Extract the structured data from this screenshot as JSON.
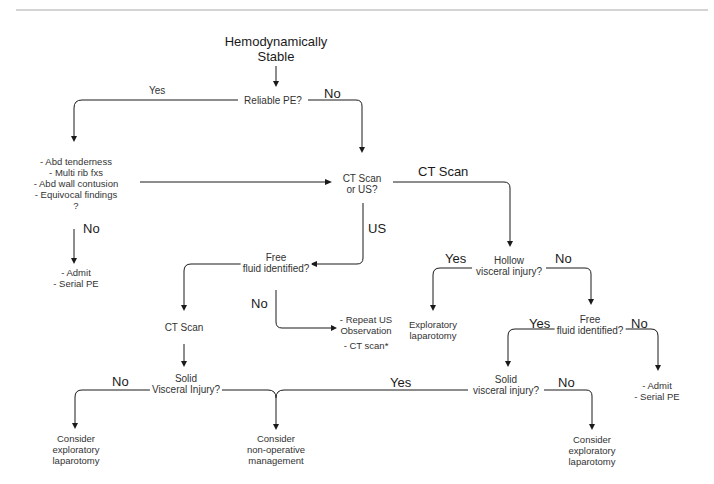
{
  "nodes": {
    "start": "Hemodynamically Stable",
    "start_l1": "Hemodynamically",
    "start_l2": "Stable",
    "reliable_pe": "Reliable PE?",
    "findings": [
      "- Abd tenderness",
      "- Multi rib fxs",
      "- Abd wall contusion",
      "- Equivocal findings",
      "?"
    ],
    "admit_serial_left": [
      "- Admit",
      "- Serial PE"
    ],
    "ct_or_us": [
      "CT Scan",
      "or US?"
    ],
    "free_fluid_us": [
      "Free",
      "fluid identified?"
    ],
    "ct_scan_mid": "CT Scan",
    "repeat_us": [
      "- Repeat US",
      "Observation",
      "- CT scan*"
    ],
    "hollow": [
      "Hollow",
      "visceral injury?"
    ],
    "exploratory": [
      "Exploratory",
      "laparotomy"
    ],
    "free_fluid_ct": [
      "Free",
      "fluid identified?"
    ],
    "admit_serial_right": [
      "- Admit",
      "- Serial PE"
    ],
    "solid_left": [
      "Solid",
      "Visceral Injury?"
    ],
    "solid_right": [
      "Solid",
      "visceral injury?"
    ],
    "consider_ex_left": [
      "Consider",
      "exploratory",
      "laparotomy"
    ],
    "consider_nonop": [
      "Consider",
      "non-operative",
      "management"
    ],
    "consider_ex_right": [
      "Consider",
      "exploratory",
      "laparotomy"
    ]
  },
  "edge_labels": {
    "reliable_yes": "Yes",
    "reliable_no": "No",
    "findings_no": "No",
    "ct_scan": "CT Scan",
    "us": "US",
    "ff_us_no": "No",
    "hollow_yes": "Yes",
    "hollow_no": "No",
    "ff_ct_yes": "Yes",
    "ff_ct_no": "No",
    "solid_left_no": "No",
    "solid_yes": "Yes",
    "solid_right_no": "No"
  },
  "colors": {
    "line": "#1a1a1a",
    "text": "#333333",
    "topbar": "#d4d4d4"
  }
}
